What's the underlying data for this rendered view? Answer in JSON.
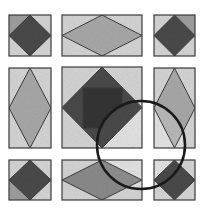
{
  "figure": {
    "width": 203,
    "height": 211,
    "background": "#ffffff",
    "stroke": "#3a3a3a",
    "colors": {
      "tile_bg": "#d4d4d4",
      "tile_corner_dark": "#9a9a9a",
      "diamond_dark": "#4a4a4a",
      "diamond_light": "#a8a8a8",
      "diamond_mid": "#8a8a8a",
      "inner_square": "#333333",
      "lens_fill_light": "#e2e2e2",
      "lens_ring": "#1a1a1a"
    },
    "tiles": [
      {
        "id": "top-left",
        "x": 9,
        "y": 15,
        "w": 42,
        "h": 41,
        "diamond": "dark",
        "dark_corner": "tl"
      },
      {
        "id": "top-middle",
        "x": 62,
        "y": 15,
        "w": 80,
        "h": 41,
        "diamond": "light",
        "dark_corner": null
      },
      {
        "id": "top-right",
        "x": 154,
        "y": 15,
        "w": 41,
        "h": 41,
        "diamond": "dark",
        "dark_corner": "tr"
      },
      {
        "id": "middle-left",
        "x": 9,
        "y": 68,
        "w": 42,
        "h": 80,
        "diamond": "light",
        "dark_corner": null
      },
      {
        "id": "center",
        "x": 62,
        "y": 67,
        "w": 80,
        "h": 81,
        "diamond": "dark",
        "dark_corner": null,
        "inner_square": {
          "x": 83,
          "y": 88,
          "w": 39,
          "h": 40
        }
      },
      {
        "id": "middle-right",
        "x": 154,
        "y": 68,
        "w": 41,
        "h": 80,
        "diamond": "light",
        "dark_corner": null
      },
      {
        "id": "bottom-left",
        "x": 9,
        "y": 160,
        "w": 42,
        "h": 40,
        "diamond": "dark",
        "dark_corner": "bl"
      },
      {
        "id": "bottom-middle",
        "x": 62,
        "y": 160,
        "w": 80,
        "h": 40,
        "diamond": "mid",
        "dark_corner": null
      },
      {
        "id": "bottom-right",
        "x": 154,
        "y": 160,
        "w": 41,
        "h": 40,
        "diamond": "dark",
        "dark_corner": null
      }
    ],
    "lens": {
      "cx": 141,
      "cy": 145,
      "r": 44,
      "stroke_width": 2.5
    }
  }
}
